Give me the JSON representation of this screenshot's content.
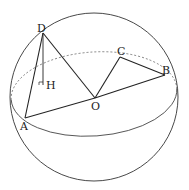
{
  "diagram": {
    "type": "sphere-geometry",
    "colors": {
      "stroke": "#333333",
      "background": "#ffffff"
    },
    "sphere": {
      "cx": 94,
      "cy": 97,
      "r": 84
    },
    "equator": {
      "cx": 94,
      "cy": 94,
      "rx": 83,
      "ry": 42,
      "rotate": -4
    },
    "points": {
      "D": {
        "label": "D",
        "x": 43,
        "y": 33
      },
      "H": {
        "label": "H",
        "x": 43,
        "y": 85
      },
      "A": {
        "label": "A",
        "x": 25,
        "y": 118
      },
      "O": {
        "label": "O",
        "x": 95,
        "y": 98
      },
      "C": {
        "label": "C",
        "x": 120,
        "y": 57
      },
      "B": {
        "label": "B",
        "x": 165,
        "y": 75
      }
    },
    "segments": [
      [
        "D",
        "A"
      ],
      [
        "D",
        "H"
      ],
      [
        "D",
        "O"
      ],
      [
        "A",
        "O"
      ],
      [
        "O",
        "B"
      ],
      [
        "O",
        "C"
      ],
      [
        "C",
        "B"
      ]
    ],
    "right_angle_marker": "H"
  }
}
